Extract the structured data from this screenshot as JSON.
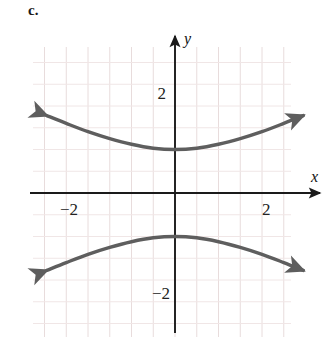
{
  "figure": {
    "part_label": "c.",
    "background_color": "#ffffff",
    "curve_color": "#5e5e5e",
    "axis_color": "#1a1a1a",
    "grid_color": "#e8dcdc",
    "grid_minor_color": "#f0e6e6"
  },
  "chart_data": {
    "type": "line",
    "title": "",
    "subtitle": "",
    "xlabel": "x",
    "ylabel": "y",
    "xlim": [
      -3,
      3
    ],
    "ylim": [
      -3.25,
      3.25
    ],
    "grid": true,
    "grid_step": 0.5,
    "legend": "none",
    "x_ticks": [
      -2,
      2
    ],
    "x_tick_labels": [
      "−2",
      "2"
    ],
    "y_ticks": [
      2,
      -2
    ],
    "y_tick_labels": [
      "2",
      "−2"
    ],
    "equation": "y² − x²/4 = 1",
    "shape": "hyperbola, vertical transverse axis",
    "vertices": [
      [
        0,
        1
      ],
      [
        0,
        -1
      ]
    ],
    "series": [
      {
        "name": "upper-branch",
        "points": [
          [
            -2.95,
            1.78
          ],
          [
            -2.5,
            1.6
          ],
          [
            -2.0,
            1.41
          ],
          [
            -1.5,
            1.25
          ],
          [
            -1.0,
            1.12
          ],
          [
            -0.5,
            1.03
          ],
          [
            0.0,
            1.0
          ],
          [
            0.5,
            1.03
          ],
          [
            1.0,
            1.12
          ],
          [
            1.5,
            1.25
          ],
          [
            2.0,
            1.41
          ],
          [
            2.5,
            1.6
          ],
          [
            2.95,
            1.78
          ]
        ],
        "arrow_start": true,
        "arrow_end": true
      },
      {
        "name": "lower-branch",
        "points": [
          [
            -2.95,
            -1.78
          ],
          [
            -2.5,
            -1.6
          ],
          [
            -2.0,
            -1.41
          ],
          [
            -1.5,
            -1.25
          ],
          [
            -1.0,
            -1.12
          ],
          [
            -0.5,
            -1.03
          ],
          [
            0.0,
            -1.0
          ],
          [
            0.5,
            -1.03
          ],
          [
            1.0,
            -1.12
          ],
          [
            1.5,
            -1.25
          ],
          [
            2.0,
            -1.41
          ],
          [
            2.5,
            -1.6
          ],
          [
            2.95,
            -1.78
          ]
        ],
        "arrow_start": true,
        "arrow_end": true
      }
    ],
    "annotations": []
  }
}
